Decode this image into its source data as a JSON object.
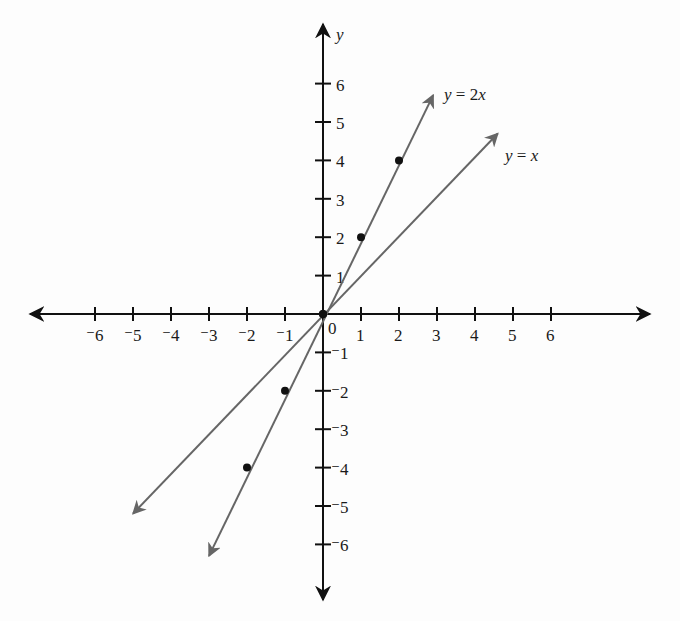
{
  "chart_data": {
    "type": "line",
    "title": "",
    "xlabel": "",
    "ylabel": "y",
    "xlim": [
      -6,
      6
    ],
    "ylim": [
      -6,
      6
    ],
    "grid": false,
    "x_ticks": [
      "⁻6",
      "⁻5",
      "⁻4",
      "⁻3",
      "⁻2",
      "⁻1",
      "0",
      "1",
      "2",
      "3",
      "4",
      "5",
      "6"
    ],
    "y_ticks": [
      "⁻6",
      "⁻5",
      "⁻4",
      "⁻3",
      "⁻2",
      "⁻1",
      "1",
      "2",
      "3",
      "4",
      "5",
      "6"
    ],
    "origin_label": "0",
    "series": [
      {
        "name": "y = 2x",
        "label_parts": [
          "y",
          " = ",
          "2",
          "x"
        ],
        "equation": "y = 2x",
        "slope": 2,
        "points": [
          [
            -2,
            -4
          ],
          [
            -1,
            -2
          ],
          [
            0,
            0
          ],
          [
            1,
            2
          ],
          [
            2,
            4
          ]
        ],
        "line_extent": [
          [
            -3.0,
            -6.3
          ],
          [
            2.9,
            5.7
          ]
        ]
      },
      {
        "name": "y = x",
        "label_parts": [
          "y",
          " = ",
          "x"
        ],
        "equation": "y = x",
        "slope": 1,
        "points": [
          [
            0,
            0
          ]
        ],
        "line_extent": [
          [
            -5.0,
            -5.2
          ],
          [
            4.6,
            4.7
          ]
        ]
      }
    ]
  },
  "colors": {
    "axis": "#111111",
    "line": "#666666",
    "point": "#111111",
    "background": "#fdfdfd"
  }
}
